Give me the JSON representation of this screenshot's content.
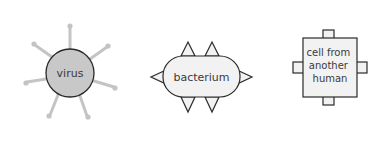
{
  "diagram": {
    "items": [
      {
        "id": "virus",
        "label": "virus",
        "shape": "circle-with-spikes",
        "fill": "#c8c8c8",
        "spike_color": "#c4c4c4"
      },
      {
        "id": "bacterium",
        "label": "bacterium",
        "shape": "rounded-rect-with-triangles",
        "fill": "#f2f2f2"
      },
      {
        "id": "cell",
        "label_lines": [
          "cell from",
          "another",
          "human"
        ],
        "shape": "square-with-tabs",
        "fill": "#f2f2f2"
      }
    ],
    "colors": {
      "stroke": "#2a2a2a",
      "text": "#3a3a3a",
      "background": "#ffffff"
    }
  }
}
